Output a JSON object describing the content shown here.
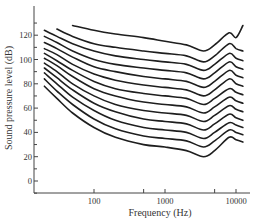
{
  "chart_data": {
    "type": "line",
    "title": "",
    "xlabel": "Frequency (Hz)",
    "ylabel": "Sound pressure level (dB)",
    "xscale": "log",
    "xlim": [
      16,
      16000
    ],
    "ylim": [
      -10,
      135
    ],
    "x_ticks": [
      100,
      1000,
      10000
    ],
    "x_tick_labels": [
      "100",
      "1000",
      "10000"
    ],
    "x_minor_ticks": [
      500,
      5000
    ],
    "y_ticks": [
      0,
      20,
      40,
      60,
      80,
      100,
      120
    ],
    "y_tick_labels": [
      "0",
      "20",
      "40",
      "60",
      "80",
      "100",
      "120"
    ],
    "grid": false,
    "legend": null,
    "x": [
      20,
      30,
      50,
      100,
      200,
      500,
      1000,
      2000,
      3500,
      5000,
      8000,
      10000,
      12500
    ],
    "series": [
      {
        "name": "contour 1",
        "start_x": 20,
        "values": [
          78,
          68,
          56,
          44,
          36,
          30,
          28,
          25,
          20,
          25,
          36,
          34,
          32
        ]
      },
      {
        "name": "contour 2",
        "start_x": 20,
        "values": [
          84,
          74,
          63,
          51,
          43,
          37,
          35,
          33,
          28,
          33,
          42,
          40,
          38
        ]
      },
      {
        "name": "contour 3",
        "start_x": 20,
        "values": [
          89,
          80,
          69,
          58,
          50,
          44,
          42,
          40,
          35,
          40,
          48,
          46,
          44
        ]
      },
      {
        "name": "contour 4",
        "start_x": 20,
        "values": [
          93,
          85,
          75,
          64,
          57,
          51,
          49,
          47,
          42,
          47,
          55,
          52,
          50
        ]
      },
      {
        "name": "contour 5",
        "start_x": 20,
        "values": [
          97,
          90,
          80,
          70,
          63,
          58,
          56,
          54,
          49,
          54,
          62,
          59,
          57
        ]
      },
      {
        "name": "contour 6",
        "start_x": 20,
        "values": [
          101,
          95,
          86,
          76,
          70,
          65,
          63,
          61,
          56,
          61,
          69,
          66,
          64
        ]
      },
      {
        "name": "contour 7",
        "start_x": 20,
        "values": [
          105,
          99,
          91,
          82,
          76,
          72,
          70,
          68,
          63,
          68,
          76,
          73,
          71
        ]
      },
      {
        "name": "contour 8",
        "start_x": 20,
        "values": [
          109,
          104,
          96,
          88,
          83,
          79,
          77,
          75,
          70,
          75,
          84,
          80,
          78
        ]
      },
      {
        "name": "contour 9",
        "start_x": 20,
        "values": [
          114,
          109,
          102,
          94,
          90,
          86,
          84,
          82,
          77,
          82,
          91,
          87,
          85
        ]
      },
      {
        "name": "contour 10",
        "start_x": 20,
        "values": [
          119,
          114,
          107,
          100,
          96,
          93,
          91,
          89,
          84,
          89,
          98,
          94,
          92
        ]
      },
      {
        "name": "contour 11",
        "start_x": 20,
        "values": [
          124,
          119,
          113,
          107,
          103,
          100,
          98,
          96,
          91,
          96,
          105,
          101,
          99
        ]
      },
      {
        "name": "contour 12",
        "start_x": 25,
        "values": [
          null,
          125,
          119,
          113,
          110,
          107,
          105,
          103,
          98,
          103,
          113,
          109,
          107
        ]
      },
      {
        "name": "contour 13",
        "start_x": 50,
        "values": [
          null,
          null,
          128,
          124,
          121,
          118,
          115,
          112,
          107,
          112,
          122,
          118,
          128
        ]
      }
    ]
  }
}
